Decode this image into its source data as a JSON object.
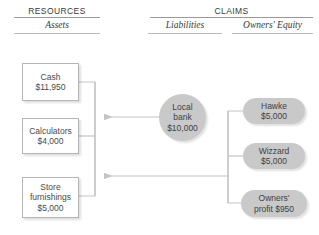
{
  "headers": {
    "resources": "RESOURCES",
    "assets": "Assets",
    "claims": "CLAIMS",
    "liabilities": "Liabilities",
    "owners_equity": "Owners' Equity"
  },
  "assets": [
    {
      "name": "Cash",
      "amount": "$11,950"
    },
    {
      "name": "Calculators",
      "amount": "$4,000"
    },
    {
      "name": "Store",
      "name2": "furnishings",
      "amount": "$5,000"
    }
  ],
  "liabilities": [
    {
      "line1": "Local",
      "line2": "bank",
      "amount": "$10,000"
    }
  ],
  "equity": [
    {
      "name": "Hawke",
      "amount": "$5,000"
    },
    {
      "name": "Wizzard",
      "amount": "$5,000"
    },
    {
      "line1": "Owners'",
      "line2": "profit $950"
    }
  ],
  "colors": {
    "ellipse_fill": "#c9c9c9",
    "box_border": "#b5b5b5",
    "rule": "#9a9a9a",
    "wire": "#c4c4c4",
    "text": "#3f3f3f"
  }
}
